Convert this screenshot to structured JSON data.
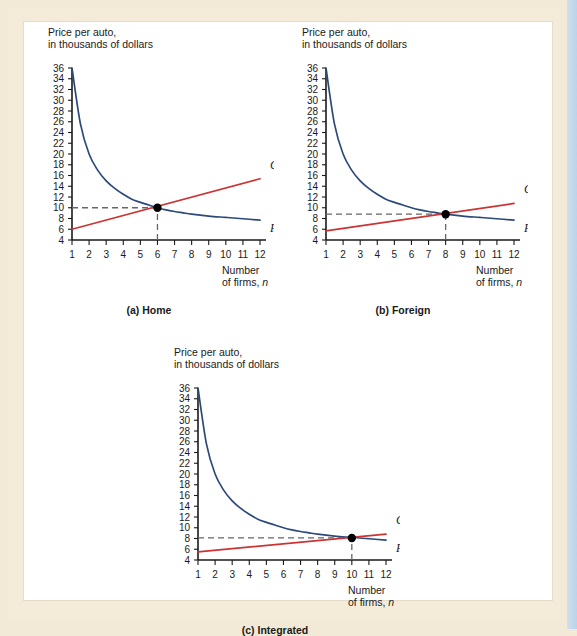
{
  "figure": {
    "background": "#f2ead6",
    "panel_background": "#ffffff"
  },
  "colors": {
    "pp_curve": "#2b4a7a",
    "cc_curve": "#cc3333",
    "axis": "#1a1a1a",
    "dashed_guide": "#666666",
    "equilibrium_dot": "#000000"
  },
  "chart_data": [
    {
      "type": "line",
      "id": "home",
      "caption": "(a) Home",
      "title": "",
      "ylabel_line1": "Price per auto,",
      "ylabel_line2": "in thousands of dollars",
      "xlabel_line1": "Number",
      "xlabel_line2": "of firms, n",
      "xlim": [
        1,
        12
      ],
      "ylim": [
        4,
        36
      ],
      "xticks": [
        1,
        2,
        3,
        4,
        5,
        6,
        7,
        8,
        9,
        10,
        11,
        12
      ],
      "yticks": [
        4,
        6,
        8,
        10,
        12,
        14,
        16,
        18,
        20,
        22,
        24,
        26,
        28,
        30,
        32,
        34,
        36
      ],
      "grid": false,
      "legend_position": "inline-right",
      "series": [
        {
          "name": "PP",
          "label": "PP",
          "color": "#2b4a7a",
          "x": [
            1,
            1.5,
            2,
            2.5,
            3,
            3.5,
            4,
            4.5,
            5,
            5.5,
            6,
            6.5,
            7,
            7.5,
            8,
            9,
            10,
            11,
            12
          ],
          "values": [
            36,
            25.5,
            20,
            17,
            15,
            13.6,
            12.5,
            11.6,
            11,
            10.5,
            10,
            9.6,
            9.3,
            9.05,
            8.8,
            8.45,
            8.2,
            7.95,
            7.7
          ]
        },
        {
          "name": "CC",
          "label": "CC",
          "color": "#cc3333",
          "x": [
            1,
            12
          ],
          "values": [
            6,
            15.4
          ]
        }
      ],
      "equilibrium": {
        "x": 6,
        "y": 10,
        "label": ""
      },
      "annotations": [
        {
          "type": "hline",
          "y": 10,
          "from_x": 1,
          "to_x": 6,
          "style": "dashed"
        },
        {
          "type": "vline",
          "x": 6,
          "from_y": 4,
          "to_y": 10,
          "style": "dashed"
        }
      ]
    },
    {
      "type": "line",
      "id": "foreign",
      "caption": "(b) Foreign",
      "title": "",
      "ylabel_line1": "Price per auto,",
      "ylabel_line2": "in thousands of dollars",
      "xlabel_line1": "Number",
      "xlabel_line2": "of firms, n",
      "xlim": [
        1,
        12
      ],
      "ylim": [
        4,
        36
      ],
      "xticks": [
        1,
        2,
        3,
        4,
        5,
        6,
        7,
        8,
        9,
        10,
        11,
        12
      ],
      "yticks": [
        4,
        6,
        8,
        10,
        12,
        14,
        16,
        18,
        20,
        22,
        24,
        26,
        28,
        30,
        32,
        34,
        36
      ],
      "grid": false,
      "legend_position": "inline-right",
      "series": [
        {
          "name": "PP",
          "label": "PP",
          "color": "#2b4a7a",
          "x": [
            1,
            1.5,
            2,
            2.5,
            3,
            3.5,
            4,
            4.5,
            5,
            5.5,
            6,
            6.5,
            7,
            7.5,
            8,
            9,
            10,
            11,
            12
          ],
          "values": [
            36,
            25.5,
            20,
            17,
            15,
            13.6,
            12.5,
            11.6,
            11,
            10.5,
            10,
            9.6,
            9.3,
            9.05,
            8.8,
            8.45,
            8.2,
            7.95,
            7.7
          ]
        },
        {
          "name": "CC",
          "label": "CC",
          "color": "#cc3333",
          "x": [
            1,
            12
          ],
          "values": [
            5.7,
            10.8
          ]
        }
      ],
      "equilibrium": {
        "x": 8,
        "y": 8.8,
        "label": ""
      },
      "annotations": [
        {
          "type": "hline",
          "y": 8.8,
          "from_x": 1,
          "to_x": 8,
          "style": "dashed"
        },
        {
          "type": "vline",
          "x": 8,
          "from_y": 4,
          "to_y": 8.8,
          "style": "dashed"
        }
      ]
    },
    {
      "type": "line",
      "id": "integrated",
      "caption": "(c) Integrated",
      "title": "",
      "ylabel_line1": "Price per auto,",
      "ylabel_line2": "in thousands of dollars",
      "xlabel_line1": "Number",
      "xlabel_line2": "of firms, n",
      "xlim": [
        1,
        12
      ],
      "ylim": [
        4,
        36
      ],
      "xticks": [
        1,
        2,
        3,
        4,
        5,
        6,
        7,
        8,
        9,
        10,
        11,
        12
      ],
      "yticks": [
        4,
        6,
        8,
        10,
        12,
        14,
        16,
        18,
        20,
        22,
        24,
        26,
        28,
        30,
        32,
        34,
        36
      ],
      "grid": false,
      "legend_position": "inline-right",
      "series": [
        {
          "name": "PP",
          "label": "PP",
          "color": "#2b4a7a",
          "x": [
            1,
            1.5,
            2,
            2.5,
            3,
            3.5,
            4,
            4.5,
            5,
            5.5,
            6,
            6.5,
            7,
            7.5,
            8,
            9,
            10,
            11,
            12
          ],
          "values": [
            36,
            25.5,
            20,
            17,
            15,
            13.6,
            12.5,
            11.6,
            11,
            10.5,
            10,
            9.6,
            9.3,
            9.05,
            8.8,
            8.45,
            8.2,
            7.95,
            7.7
          ]
        },
        {
          "name": "CC",
          "label": "CC",
          "color": "#cc3333",
          "x": [
            1,
            12
          ],
          "values": [
            5.5,
            8.8
          ]
        }
      ],
      "equilibrium": {
        "x": 10,
        "y": 8.1,
        "label": ""
      },
      "annotations": [
        {
          "type": "hline",
          "y": 8.1,
          "from_x": 1,
          "to_x": 10,
          "style": "dashed"
        },
        {
          "type": "vline",
          "x": 10,
          "from_y": 4,
          "to_y": 8.1,
          "style": "dashed"
        }
      ]
    }
  ]
}
